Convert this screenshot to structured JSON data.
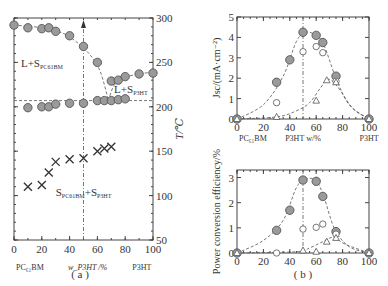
{
  "figure": {
    "caption_a": "( a )",
    "caption_b": "( b )"
  },
  "chart_data": [
    {
      "id": "a",
      "type": "scatter",
      "title": "",
      "xlabel": "w_P3HT /%",
      "xlabel_left": "PC61BM",
      "xlabel_right": "P3HT",
      "ylabel": "T/℃",
      "xlim": [
        0,
        100
      ],
      "ylim": [
        50,
        300
      ],
      "xticks": [
        0,
        20,
        40,
        60,
        80,
        100
      ],
      "yticks": [
        50,
        100,
        150,
        200,
        250,
        300
      ],
      "grid": false,
      "annotations": [
        {
          "text": "L+S",
          "sub": "PC61BM",
          "x": 18,
          "y": 247
        },
        {
          "text": "L+S",
          "sub": "P3HT",
          "x": 72,
          "y": 218
        },
        {
          "text": "S",
          "sub": "PC61BM",
          "text2": "+S",
          "sub2": "P3HT",
          "x": 30,
          "y": 102
        }
      ],
      "reference_lines": {
        "eutectic_T": 207,
        "vertical_x": 50
      },
      "series": [
        {
          "name": "liquidus",
          "marker": "filled-circle",
          "points": [
            [
              0,
              292
            ],
            [
              10,
              289
            ],
            [
              20,
              288
            ],
            [
              25,
              289
            ],
            [
              30,
              285
            ],
            [
              40,
              280
            ],
            [
              50,
              268
            ],
            [
              60,
              250
            ],
            [
              70,
              229
            ],
            [
              75,
              230
            ],
            [
              80,
              234
            ],
            [
              90,
              237
            ],
            [
              100,
              238
            ]
          ]
        },
        {
          "name": "eutectic",
          "marker": "filled-circle",
          "points": [
            [
              10,
              199
            ],
            [
              20,
              200
            ],
            [
              25,
              200
            ],
            [
              30,
              203
            ],
            [
              40,
              204
            ],
            [
              50,
              204
            ],
            [
              60,
              207
            ],
            [
              65,
              207
            ],
            [
              70,
              207
            ],
            [
              75,
              208
            ],
            [
              80,
              209
            ]
          ]
        },
        {
          "name": "crystallization",
          "marker": "cross",
          "points": [
            [
              10,
              110
            ],
            [
              20,
              112
            ],
            [
              25,
              126
            ],
            [
              30,
              138
            ],
            [
              40,
              141
            ],
            [
              50,
              142
            ],
            [
              60,
              150
            ],
            [
              65,
              153
            ],
            [
              70,
              155
            ]
          ]
        }
      ]
    },
    {
      "id": "b-top",
      "type": "scatter",
      "xlabel": "P3HT w/%",
      "xlabel_left": "PC61BM",
      "xlabel_right": "P3HT",
      "ylabel": "Jsc/(mA·cm⁻²)",
      "xlim": [
        0,
        100
      ],
      "ylim": [
        0,
        5
      ],
      "xticks": [
        0,
        20,
        40,
        60,
        80,
        100
      ],
      "yticks": [
        0,
        1,
        2,
        3,
        4,
        5
      ],
      "series": [
        {
          "name": "filled",
          "marker": "filled-circle",
          "points": [
            [
              0,
              0
            ],
            [
              30,
              1.8
            ],
            [
              40,
              2.9
            ],
            [
              50,
              4.25
            ],
            [
              60,
              4.1
            ],
            [
              65,
              3.75
            ],
            [
              75,
              2.1
            ],
            [
              100,
              0
            ]
          ]
        },
        {
          "name": "open-circle",
          "marker": "open-circle",
          "points": [
            [
              30,
              0.8
            ],
            [
              50,
              3.3
            ],
            [
              60,
              3.55
            ],
            [
              65,
              3.25
            ],
            [
              75,
              1.85
            ]
          ]
        },
        {
          "name": "triangle",
          "marker": "open-triangle",
          "points": [
            [
              0,
              0
            ],
            [
              30,
              0.1
            ],
            [
              60,
              0.9
            ],
            [
              68,
              1.9
            ],
            [
              75,
              1.8
            ],
            [
              100,
              0
            ]
          ]
        }
      ]
    },
    {
      "id": "b-bottom",
      "type": "scatter",
      "xlabel": "",
      "ylabel": "Power conversion efficiency/%",
      "xlim": [
        0,
        100
      ],
      "ylim": [
        0,
        3.3
      ],
      "xticks": [
        0,
        20,
        40,
        60,
        80,
        100
      ],
      "yticks": [
        0,
        1,
        2,
        3
      ],
      "series": [
        {
          "name": "filled",
          "marker": "filled-circle",
          "points": [
            [
              0,
              0
            ],
            [
              30,
              0.9
            ],
            [
              40,
              1.7
            ],
            [
              50,
              2.9
            ],
            [
              60,
              2.85
            ],
            [
              65,
              2.25
            ],
            [
              75,
              0.85
            ],
            [
              100,
              0
            ]
          ]
        },
        {
          "name": "open-circle",
          "marker": "open-circle",
          "points": [
            [
              30,
              0
            ],
            [
              50,
              0.95
            ],
            [
              60,
              1.02
            ],
            [
              65,
              1.15
            ],
            [
              75,
              0.75
            ]
          ]
        },
        {
          "name": "triangle",
          "marker": "open-triangle",
          "points": [
            [
              0,
              0
            ],
            [
              50,
              0.1
            ],
            [
              60,
              0.05
            ],
            [
              68,
              0.45
            ],
            [
              75,
              0.6
            ],
            [
              100,
              0
            ]
          ]
        }
      ]
    }
  ]
}
